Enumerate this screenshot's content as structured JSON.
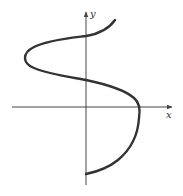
{
  "diagram": {
    "type": "curve-plot",
    "axes": {
      "x_label": "x",
      "y_label": "y",
      "color": "#444444"
    },
    "curve": {
      "color": "#333333",
      "description": "S-shaped curve x as a function of y, crossing the y-axis twice above the origin, bulging left above and right below, crossing the x-axis at the right extremum",
      "points": [
        [
          115,
          20
        ],
        [
          86,
          36
        ],
        [
          50,
          45
        ],
        [
          26,
          57
        ],
        [
          45,
          72
        ],
        [
          86,
          80
        ],
        [
          130,
          95
        ],
        [
          139,
          108
        ],
        [
          135,
          140
        ],
        [
          110,
          165
        ],
        [
          86,
          174
        ]
      ]
    }
  }
}
